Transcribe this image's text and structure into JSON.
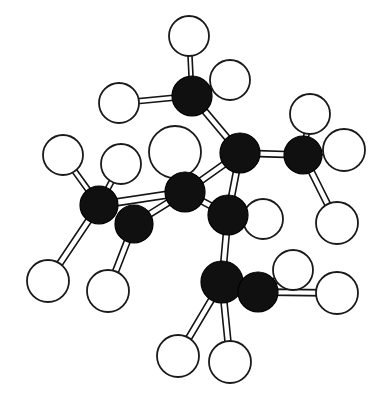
{
  "figure": {
    "kind": "ball-and-stick molecular model",
    "title": "",
    "caption": "",
    "width": 379,
    "height": 404,
    "background_color": "#ffffff"
  },
  "style": {
    "carbon_fill": "#101010",
    "carbon_stroke": "#000000",
    "hydrogen_fill": "#ffffff",
    "hydrogen_stroke": "#1a1a1a",
    "bond_stroke": "#141414",
    "bond_fill": "#ffffff",
    "bond_stroke_width": 1.6,
    "hydrogen_stroke_width": 1.8,
    "carbon_stroke_width": 1.2
  },
  "atoms": [
    {
      "id": "C1",
      "element": "C",
      "label": "carbon",
      "x": 192,
      "y": 96,
      "r": 20
    },
    {
      "id": "C2",
      "element": "C",
      "label": "carbon",
      "x": 240,
      "y": 153,
      "r": 20
    },
    {
      "id": "C3",
      "element": "C",
      "label": "carbon",
      "x": 303,
      "y": 155,
      "r": 19
    },
    {
      "id": "C4",
      "element": "C",
      "label": "carbon",
      "x": 185,
      "y": 192,
      "r": 20
    },
    {
      "id": "C5",
      "element": "C",
      "label": "carbon",
      "x": 228,
      "y": 215,
      "r": 20
    },
    {
      "id": "C6",
      "element": "C",
      "label": "carbon",
      "x": 99,
      "y": 205,
      "r": 19
    },
    {
      "id": "C7",
      "element": "C",
      "label": "carbon",
      "x": 134,
      "y": 224,
      "r": 19
    },
    {
      "id": "C8",
      "element": "C",
      "label": "carbon",
      "x": 222,
      "y": 282,
      "r": 21
    },
    {
      "id": "C9",
      "element": "C",
      "label": "carbon",
      "x": 258,
      "y": 292,
      "r": 20
    },
    {
      "id": "H1",
      "element": "H",
      "label": "hydrogen",
      "x": 189,
      "y": 36,
      "r": 20
    },
    {
      "id": "H2",
      "element": "H",
      "label": "hydrogen",
      "x": 230,
      "y": 80,
      "r": 20
    },
    {
      "id": "H3",
      "element": "H",
      "label": "hydrogen",
      "x": 119,
      "y": 103,
      "r": 20
    },
    {
      "id": "H4",
      "element": "H",
      "label": "hydrogen",
      "x": 310,
      "y": 114,
      "r": 20
    },
    {
      "id": "H5",
      "element": "H",
      "label": "hydrogen",
      "x": 344,
      "y": 150,
      "r": 21
    },
    {
      "id": "H6",
      "element": "H",
      "label": "hydrogen",
      "x": 337,
      "y": 223,
      "r": 21
    },
    {
      "id": "H7",
      "element": "H",
      "label": "hydrogen",
      "x": 175,
      "y": 152,
      "r": 26
    },
    {
      "id": "H8",
      "element": "H",
      "label": "hydrogen",
      "x": 121,
      "y": 164,
      "r": 20
    },
    {
      "id": "H9",
      "element": "H",
      "label": "hydrogen",
      "x": 63,
      "y": 155,
      "r": 20
    },
    {
      "id": "H10",
      "element": "H",
      "label": "hydrogen",
      "x": 263,
      "y": 219,
      "r": 20
    },
    {
      "id": "H11",
      "element": "H",
      "label": "hydrogen",
      "x": 48,
      "y": 281,
      "r": 21
    },
    {
      "id": "H12",
      "element": "H",
      "label": "hydrogen",
      "x": 108,
      "y": 291,
      "r": 21
    },
    {
      "id": "H13",
      "element": "H",
      "label": "hydrogen",
      "x": 178,
      "y": 356,
      "r": 21
    },
    {
      "id": "H14",
      "element": "H",
      "label": "hydrogen",
      "x": 230,
      "y": 362,
      "r": 21
    },
    {
      "id": "H15",
      "element": "H",
      "label": "hydrogen",
      "x": 293,
      "y": 270,
      "r": 20
    },
    {
      "id": "H16",
      "element": "H",
      "label": "hydrogen",
      "x": 337,
      "y": 293,
      "r": 21
    }
  ],
  "bonds": [
    {
      "from": "C1",
      "to": "H1",
      "kind": "C-H",
      "w": 4
    },
    {
      "from": "C1",
      "to": "H2",
      "kind": "C-H",
      "w": 4
    },
    {
      "from": "C1",
      "to": "H3",
      "kind": "C-H",
      "w": 5
    },
    {
      "from": "C1",
      "to": "C2",
      "kind": "C-C",
      "w": 6
    },
    {
      "from": "C2",
      "to": "C3",
      "kind": "C-C",
      "w": 6
    },
    {
      "from": "C2",
      "to": "C5",
      "kind": "C-C",
      "w": 6
    },
    {
      "from": "C3",
      "to": "H4",
      "kind": "C-H",
      "w": 5
    },
    {
      "from": "C3",
      "to": "H5",
      "kind": "C-H",
      "w": 4
    },
    {
      "from": "C3",
      "to": "H6",
      "kind": "C-H",
      "w": 6
    },
    {
      "from": "C4",
      "to": "H7",
      "kind": "C-H",
      "w": 5
    },
    {
      "from": "C4",
      "to": "C2",
      "kind": "C-C",
      "w": 6
    },
    {
      "from": "C4",
      "to": "C7",
      "kind": "C-C",
      "w": 6
    },
    {
      "from": "C4",
      "to": "C5",
      "kind": "C-C",
      "w": 6
    },
    {
      "from": "C5",
      "to": "H10",
      "kind": "C-H",
      "w": 5
    },
    {
      "from": "C5",
      "to": "C8",
      "kind": "C-C",
      "w": 6
    },
    {
      "from": "C6",
      "to": "H8",
      "kind": "C-H",
      "w": 5
    },
    {
      "from": "C6",
      "to": "H9",
      "kind": "C-H",
      "w": 5
    },
    {
      "from": "C6",
      "to": "H11",
      "kind": "C-H",
      "w": 6
    },
    {
      "from": "C6",
      "to": "C4",
      "kind": "C-C",
      "w": 7
    },
    {
      "from": "C7",
      "to": "H12",
      "kind": "C-H",
      "w": 6
    },
    {
      "from": "C8",
      "to": "H13",
      "kind": "C-H",
      "w": 6
    },
    {
      "from": "C8",
      "to": "H14",
      "kind": "C-H",
      "w": 6
    },
    {
      "from": "C9",
      "to": "H15",
      "kind": "C-H",
      "w": 6
    },
    {
      "from": "C9",
      "to": "H16",
      "kind": "C-H",
      "w": 6
    },
    {
      "from": "C9",
      "to": "C8",
      "kind": "C-C",
      "w": 6
    }
  ]
}
